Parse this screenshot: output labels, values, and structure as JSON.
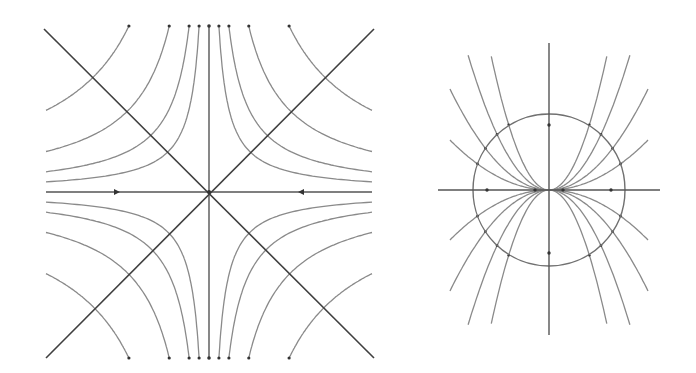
{
  "figure": {
    "panels": [
      {
        "id": "saddle-phase-portrait",
        "description": "Phase portrait of a saddle point: hyperbolic trajectories in four quadrants, horizontal axis flowing inward, vertical axis flowing outward, diagonal separatrices",
        "center": [
          209,
          192
        ],
        "half_width": 163,
        "half_height": 166,
        "hyperbola_constants": [
          1650,
          3300,
          6600,
          13300
        ],
        "axis_arrows": [
          {
            "x": 116,
            "y": 192,
            "direction": "right"
          },
          {
            "x": 302,
            "y": 192,
            "direction": "left"
          }
        ],
        "colors": {
          "curve": "#8a8a8a",
          "axis": "#555555",
          "diagonal": "#3f3f3f",
          "marker": "#333333"
        }
      },
      {
        "id": "degenerate-node-phase-portrait",
        "description": "Phase portrait with parabolic trajectories tangent to the horizontal axis at the origin, enclosed by a reference circle",
        "center": [
          549,
          190
        ],
        "circle_radius": 76,
        "parabola_coefficients": [
          0.0051,
          0.0103,
          0.0206,
          0.0401
        ],
        "x_extent": 99,
        "axis_markers": [
          {
            "x": 549,
            "y": 125
          },
          {
            "x": 549,
            "y": 253
          },
          {
            "x": 487,
            "y": 190
          },
          {
            "x": 611,
            "y": 190
          },
          {
            "x": 535,
            "y": 190
          },
          {
            "x": 563,
            "y": 190
          }
        ],
        "colors": {
          "curve": "#8a8a8a",
          "axis": "#555555",
          "circle": "#707070",
          "marker": "#333333"
        }
      }
    ]
  }
}
